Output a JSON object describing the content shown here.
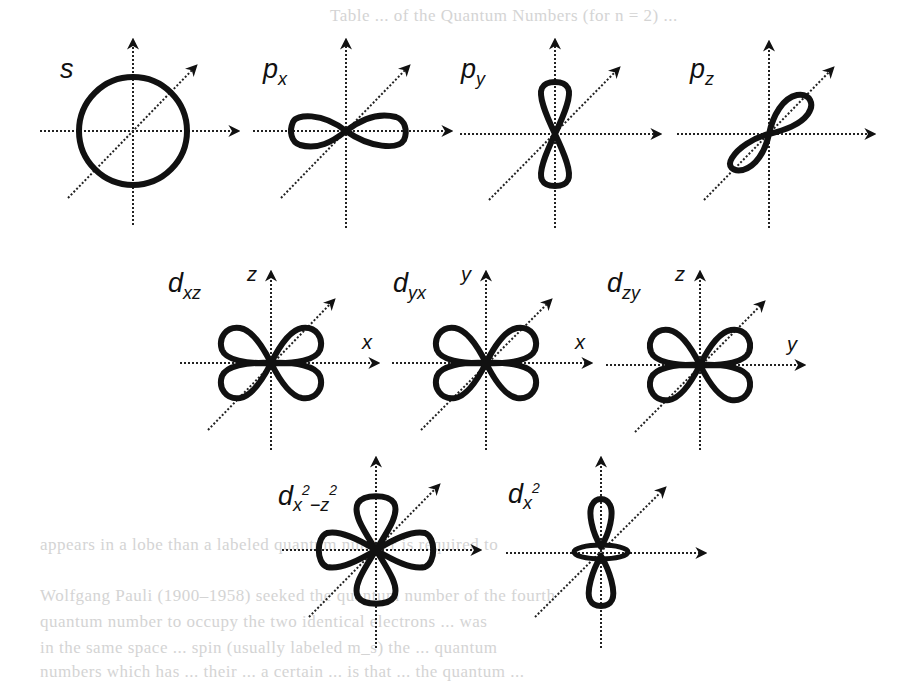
{
  "figure": {
    "rows": [
      {
        "orbitals": [
          {
            "id": "s",
            "label_main": "s",
            "label_sub": "",
            "shape": "sphere",
            "axis_labels": {
              "vertical": "",
              "horizontal": ""
            }
          },
          {
            "id": "px",
            "label_main": "p",
            "label_sub": "x",
            "shape": "dumbbell-x",
            "axis_labels": {
              "vertical": "",
              "horizontal": ""
            }
          },
          {
            "id": "py",
            "label_main": "p",
            "label_sub": "y",
            "shape": "dumbbell-y",
            "axis_labels": {
              "vertical": "",
              "horizontal": ""
            }
          },
          {
            "id": "pz",
            "label_main": "p",
            "label_sub": "z",
            "shape": "dumbbell-z",
            "axis_labels": {
              "vertical": "",
              "horizontal": ""
            }
          }
        ]
      },
      {
        "orbitals": [
          {
            "id": "dxz",
            "label_main": "d",
            "label_sub": "xz",
            "shape": "cloverleaf",
            "axis_labels": {
              "vertical": "z",
              "horizontal": "x"
            }
          },
          {
            "id": "dyx",
            "label_main": "d",
            "label_sub": "yx",
            "shape": "cloverleaf",
            "axis_labels": {
              "vertical": "y",
              "horizontal": "x"
            }
          },
          {
            "id": "dzy",
            "label_main": "d",
            "label_sub": "zy",
            "shape": "cloverleaf",
            "axis_labels": {
              "vertical": "z",
              "horizontal": "y"
            }
          }
        ]
      },
      {
        "orbitals": [
          {
            "id": "dx2-z2",
            "label_main": "d",
            "label_sub": "x",
            "label_sup1": "2",
            "label_mid": "−z",
            "label_sup2": "2",
            "shape": "cloverleaf-axial",
            "axis_labels": {
              "vertical": "",
              "horizontal": ""
            }
          },
          {
            "id": "dx2",
            "label_main": "d",
            "label_sub": "x",
            "label_sup1": "2",
            "shape": "dumbbell-torus",
            "axis_labels": {
              "vertical": "",
              "horizontal": ""
            }
          }
        ]
      }
    ]
  },
  "background_text": {
    "top_line": "Table ... of the Quantum Numbers (for n = 2) ...",
    "para_line_1": "appears in a lobe than a labeled quantum number is required to",
    "para_line_2": "specify the lines ...",
    "para_line_3": "Wolfgang Pauli (1900–1958) seeked the quantum number of the fourth",
    "para_line_4": "quantum number to occupy the two identical electrons ... was",
    "para_line_5": "in the same space ... spin (usually labeled m_s) the ... quantum",
    "para_line_6": "numbers which has ... their ... a certain ... is that ... the quantum ..."
  },
  "colors": {
    "ink": "#111111",
    "axis": "#222222",
    "background": "#ffffff",
    "ghost_text": "#d4d4d4"
  }
}
